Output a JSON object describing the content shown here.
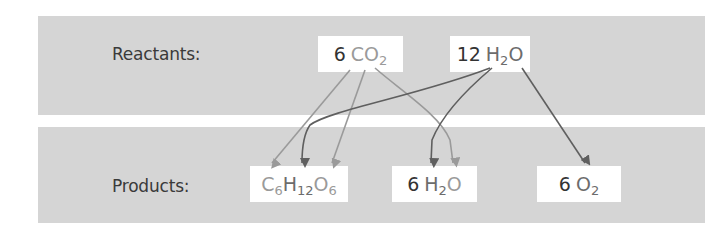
{
  "diagram": {
    "rows": {
      "reactants": {
        "label": "Reactants:"
      },
      "products": {
        "label": "Products:"
      }
    },
    "reactants": [
      {
        "id": "co2",
        "coefficient": "6",
        "formula": [
          {
            "t": "C"
          },
          {
            "t": "O"
          },
          {
            "t": "2",
            "sub": true
          }
        ]
      },
      {
        "id": "h2o",
        "coefficient": "12",
        "formula": [
          {
            "t": "H"
          },
          {
            "t": "2",
            "sub": true
          },
          {
            "t": "O"
          }
        ]
      }
    ],
    "products": [
      {
        "id": "glucose",
        "coefficient": "",
        "formula": [
          {
            "t": "C"
          },
          {
            "t": "6",
            "sub": true
          },
          {
            "t": "H"
          },
          {
            "t": "12",
            "sub": true
          },
          {
            "t": "O"
          },
          {
            "t": "6",
            "sub": true
          }
        ]
      },
      {
        "id": "h2o",
        "coefficient": "6",
        "formula": [
          {
            "t": "H"
          },
          {
            "t": "2",
            "sub": true
          },
          {
            "t": "O"
          }
        ]
      },
      {
        "id": "o2",
        "coefficient": "6",
        "formula": [
          {
            "t": "O"
          },
          {
            "t": "2",
            "sub": true
          }
        ]
      }
    ],
    "arrows": [
      {
        "from": "CO2 (C)",
        "to": "C6H12O6 (C)",
        "color": "#9a9a9a"
      },
      {
        "from": "CO2 (O)",
        "to": "C6H12O6 (O)",
        "color": "#9a9a9a"
      },
      {
        "from": "CO2 (O)",
        "to": "6 H2O (O)",
        "color": "#9a9a9a"
      },
      {
        "from": "12 H2O (H)",
        "to": "C6H12O6 (H)",
        "color": "#5f5f5f"
      },
      {
        "from": "12 H2O (H)",
        "to": "6 H2O (H)",
        "color": "#5f5f5f"
      },
      {
        "from": "12 H2O (O)",
        "to": "6 O2 (O)",
        "color": "#5f5f5f"
      }
    ],
    "colors": {
      "panel": "#d5d5d5",
      "box": "#ffffff",
      "text": "#333333",
      "light_arrow": "#9a9a9a",
      "dark_arrow": "#5f5f5f"
    }
  },
  "text": {
    "co2_coef": "6",
    "co2_c": "C",
    "co2_o": "O",
    "co2_sub": "2",
    "h2o_r_coef": "12",
    "h2o_r_h": "H",
    "h2o_r_sub": "2",
    "h2o_r_o": "O",
    "glu_c": "C",
    "glu_c_sub": "6",
    "glu_h": "H",
    "glu_h_sub": "12",
    "glu_o": "O",
    "glu_o_sub": "6",
    "h2o_p_coef": "6",
    "h2o_p_h": "H",
    "h2o_p_sub": "2",
    "h2o_p_o": "O",
    "o2_coef": "6",
    "o2_o": "O",
    "o2_sub": "2"
  }
}
